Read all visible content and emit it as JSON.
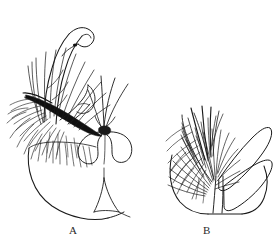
{
  "plate": {
    "kind": "scientific-line-drawing",
    "background_color": "#ffffff",
    "ink_color": "#1a1a1a",
    "description": "Two stippled pen-and-ink line drawings of insect terminalia appendages, side by side, each labelled beneath.",
    "panels": [
      {
        "id": "A",
        "label": "A",
        "parts": [
          "hooked-apical-process",
          "heavy-black-sclerotized-bar",
          "dense-marginal-setae",
          "bilobed-median-structure",
          "rounded-basal-plate",
          "small-triangular-sternite"
        ]
      },
      {
        "id": "B",
        "label": "B",
        "parts": [
          "dense-setose-lobe",
          "upper-smooth-lobe",
          "lower-smooth-lobe",
          "rounded-basal-plate",
          "median-cleft"
        ]
      }
    ],
    "caption_fragment_left": "",
    "caption_fragment_right": ""
  },
  "labels": {
    "a": "A",
    "b": "B"
  },
  "colors": {
    "ink": "#1a1a1a",
    "paper": "#ffffff",
    "label_text": "#2b2b2b",
    "caption_ghost": "#b9b9b9"
  }
}
